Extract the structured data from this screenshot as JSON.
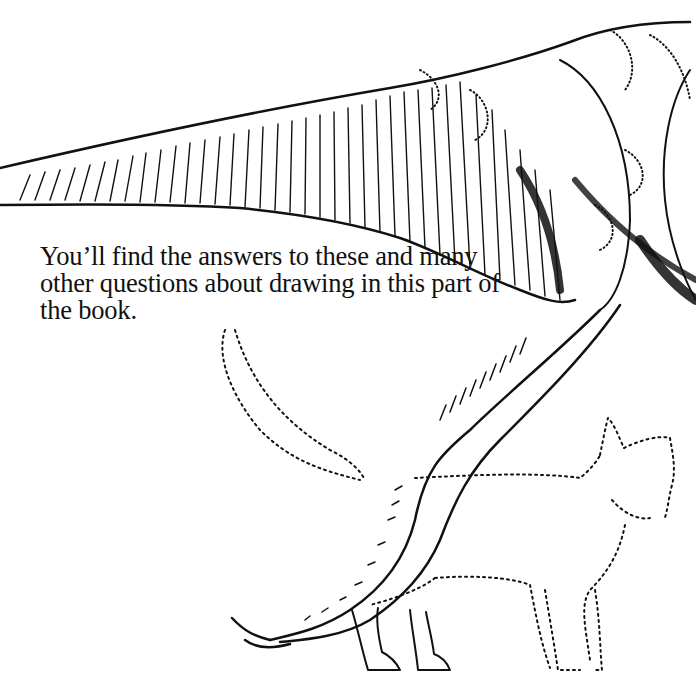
{
  "page": {
    "paragraph": {
      "lines": [
        "You’ll find the answers to these and many",
        "other questions about drawing in this part of",
        "the book."
      ]
    },
    "illustration": {
      "subjects": [
        "dinosaur-tail-and-leg",
        "dotted-cat-outline"
      ],
      "ink_color": "#111111",
      "paper_color": "#ffffff"
    }
  }
}
